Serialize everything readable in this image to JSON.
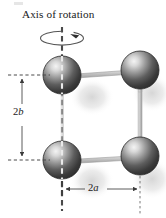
{
  "figure": {
    "kind": "physics-diagram",
    "caption": "Axis of rotation",
    "labels": {
      "vertical_dimension": "2b",
      "vertical_dimension_prefix": "2",
      "vertical_dimension_symbol": "b",
      "horizontal_dimension": "2a",
      "horizontal_dimension_prefix": "2",
      "horizontal_dimension_symbol": "a"
    },
    "colors": {
      "background": "#ffffff",
      "text": "#1a1a1a",
      "sphere_dark": "#3a3a3a",
      "sphere_mid": "#8c8c8c",
      "sphere_highlight": "#f2f2f2",
      "sphere_edge": "#2a2a2a",
      "rod": "#b8b8b8",
      "rod_edge": "#8a8a8a",
      "axis_line": "#4a4a4a",
      "dimension_line": "#5a5a5a",
      "shadow": "#d6d6d6"
    },
    "spheres": [
      {
        "name": "sphere-top-left",
        "cx": 62,
        "cy": 75,
        "r": 19
      },
      {
        "name": "sphere-top-right",
        "cx": 140,
        "cy": 70,
        "r": 19
      },
      {
        "name": "sphere-bottom-left",
        "cx": 62,
        "cy": 160,
        "r": 19
      },
      {
        "name": "sphere-bottom-right",
        "cx": 140,
        "cy": 156,
        "r": 19
      }
    ],
    "rotation_axis": {
      "x": 62,
      "y_top": 27,
      "y_bottom": 210,
      "style": "dashed"
    },
    "rotation_arrow": {
      "type": "elliptical-arrow",
      "cx": 62,
      "cy": 38,
      "rx": 22,
      "ry": 7
    },
    "right_reference_line": {
      "x": 140,
      "y_top": 178,
      "y_bottom": 214,
      "style": "dotted"
    },
    "dimension_2b": {
      "x": 22,
      "y_top": 75,
      "y_bottom": 160,
      "arrowheads": "both"
    },
    "dimension_2a": {
      "y": 189,
      "x_left": 62,
      "x_right": 140,
      "arrowheads": "both"
    },
    "extension_ticks": [
      {
        "name": "tick-left-top",
        "y": 75,
        "x_start": 8,
        "x_end": 50
      },
      {
        "name": "tick-left-bottom",
        "y": 160,
        "x_start": 8,
        "x_end": 50
      }
    ]
  }
}
